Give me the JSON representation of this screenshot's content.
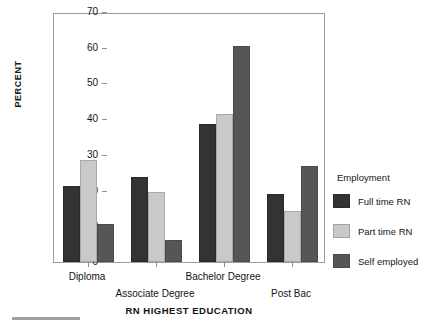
{
  "chart_data": {
    "type": "bar",
    "title": "",
    "xlabel": "RN HIGHEST EDUCATION",
    "ylabel": "PERCENT",
    "categories": [
      "Diploma",
      "Associate Degree",
      "Bachelor Degree",
      "Post Bac"
    ],
    "series": [
      {
        "name": "Full time RN",
        "color": "#333333",
        "values": [
          21.3,
          23.8,
          38.6,
          19.1
        ]
      },
      {
        "name": "Part time RN",
        "color": "#c9c9c9",
        "values": [
          28.5,
          19.6,
          41.4,
          14.3
        ]
      },
      {
        "name": "Self employed",
        "color": "#565656",
        "values": [
          10.7,
          6.1,
          60.5,
          26.8
        ]
      }
    ],
    "ylim": [
      0,
      70
    ],
    "yticks": [
      0,
      10,
      20,
      30,
      40,
      50,
      60,
      70
    ],
    "ytick_labels": [
      "0",
      "10",
      "20",
      "30",
      "40",
      "50",
      "60",
      "70"
    ],
    "grid": false,
    "legend": {
      "title": "Employment",
      "position": "right"
    }
  },
  "axis": {
    "y_title": "PERCENT",
    "x_title": "RN HIGHEST EDUCATION"
  },
  "legend": {
    "title": "Employment",
    "entries": [
      {
        "label": "Full time RN"
      },
      {
        "label": "Part time RN"
      },
      {
        "label": "Self employed"
      }
    ]
  }
}
